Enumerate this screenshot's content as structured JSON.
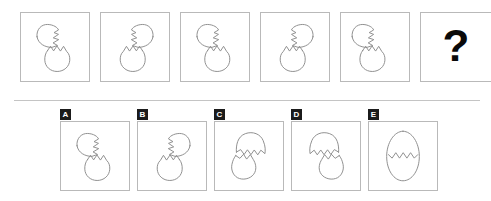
{
  "puzzle": {
    "type": "visual-analogy-sequence",
    "question_mark": "?",
    "divider_present": true,
    "sequence": [
      {
        "position": 1,
        "icon": "cracked-egg-top-shell-left",
        "orientation": "left",
        "label": ""
      },
      {
        "position": 2,
        "icon": "cracked-egg-top-shell-right",
        "orientation": "right",
        "label": ""
      },
      {
        "position": 3,
        "icon": "cracked-egg-top-shell-left",
        "orientation": "left",
        "label": ""
      },
      {
        "position": 4,
        "icon": "cracked-egg-top-shell-right",
        "orientation": "right",
        "label": ""
      },
      {
        "position": 5,
        "icon": "cracked-egg-top-shell-left",
        "orientation": "left",
        "label": ""
      },
      {
        "position": 6,
        "icon": "question-mark",
        "orientation": "none",
        "label": "?"
      }
    ],
    "options": [
      {
        "key": "A",
        "icon": "cracked-egg-top-shell-left",
        "orientation": "left"
      },
      {
        "key": "B",
        "icon": "cracked-egg-top-shell-right",
        "orientation": "right"
      },
      {
        "key": "C",
        "icon": "inverted-egg-dome-top-right",
        "orientation": "right"
      },
      {
        "key": "D",
        "icon": "inverted-egg-dome-top-left",
        "orientation": "left"
      },
      {
        "key": "E",
        "icon": "whole-egg-with-zigzag-crack",
        "orientation": "none"
      }
    ]
  },
  "colors": {
    "background": "#ffffff",
    "cell_border": "#b9b9b9",
    "shape_stroke": "#8d8d8d",
    "badge_background": "#1b1b1b",
    "badge_text": "#ffffff",
    "question_mark": "#0a0a0a",
    "divider": "#c4c4c4"
  }
}
